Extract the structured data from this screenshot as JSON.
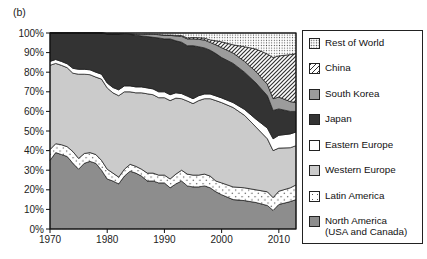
{
  "panel_label": "(b)",
  "chart_data": {
    "type": "area",
    "subtype": "stacked-100-percent",
    "title": "",
    "xlabel": "",
    "ylabel": "",
    "x_range": [
      1970,
      2013
    ],
    "x_ticks": [
      1970,
      1980,
      1990,
      2000,
      2010
    ],
    "y_ticks": [
      0,
      10,
      20,
      30,
      40,
      50,
      60,
      70,
      80,
      90,
      100
    ],
    "y_tick_suffix": "%",
    "ylim": [
      0,
      100
    ],
    "grid": false,
    "legend_position": "right",
    "years": [
      1970,
      1971,
      1972,
      1973,
      1974,
      1975,
      1976,
      1977,
      1978,
      1979,
      1980,
      1981,
      1982,
      1983,
      1984,
      1985,
      1986,
      1987,
      1988,
      1989,
      1990,
      1991,
      1992,
      1993,
      1994,
      1995,
      1996,
      1997,
      1998,
      1999,
      2000,
      2002,
      2004,
      2006,
      2008,
      2009,
      2010,
      2012,
      2013
    ],
    "series": [
      {
        "id": "north-america",
        "name": "North America (USA and Canada)",
        "fill": "#8d8d8d",
        "values": [
          35,
          39,
          38,
          37,
          33.5,
          30.5,
          33.5,
          34.5,
          33.5,
          30,
          25.5,
          24.5,
          23,
          27,
          29.5,
          28.5,
          27,
          24.5,
          24.5,
          23.5,
          23.5,
          21,
          23,
          24.5,
          22,
          21.5,
          21.5,
          22,
          21,
          19,
          17.5,
          15,
          14.5,
          13.5,
          12,
          9.5,
          12.5,
          14,
          15
        ]
      },
      {
        "id": "latin-america",
        "name": "Latin America",
        "fill": "p-dots-sparse",
        "values": [
          5.5,
          4.5,
          5,
          5,
          6,
          5.5,
          5,
          4.5,
          4.5,
          5,
          5,
          4,
          3.5,
          3.5,
          3.5,
          3.5,
          3.5,
          4,
          4,
          4,
          4,
          4.5,
          5,
          5.5,
          6,
          6,
          6,
          6,
          6,
          5.5,
          6,
          6.5,
          6.5,
          6.5,
          7,
          6.5,
          6.8,
          7,
          7.5
        ]
      },
      {
        "id": "western-europe",
        "name": "Western Europe",
        "fill": "#cbcbcb",
        "values": [
          43,
          41,
          40.5,
          40.3,
          40,
          43,
          40.5,
          39.7,
          39.5,
          41.5,
          41.5,
          41,
          41.5,
          39.5,
          37,
          37.5,
          39,
          40.5,
          40,
          39.5,
          39.5,
          40,
          38.8,
          36.5,
          37.3,
          36.5,
          38,
          38.5,
          39.5,
          41,
          41,
          40.5,
          37,
          32,
          27,
          24,
          22,
          20.5,
          20
        ]
      },
      {
        "id": "eastern-europe",
        "name": "Eastern Europe",
        "fill": "#ffffff",
        "values": [
          2,
          2,
          2,
          2,
          2.5,
          2.5,
          2.5,
          2.5,
          2.5,
          2.5,
          2.5,
          2.7,
          3,
          3,
          3,
          3,
          3,
          3,
          3,
          3,
          3,
          3,
          2.7,
          2.6,
          2.5,
          2.5,
          2.5,
          2.4,
          2.4,
          2.4,
          2.4,
          2.5,
          3,
          4,
          5.5,
          6,
          6.5,
          7,
          7
        ]
      },
      {
        "id": "japan",
        "name": "Japan",
        "fill": "#333333",
        "values": [
          14.5,
          13.5,
          14.5,
          15.7,
          18,
          18.5,
          18.5,
          18.8,
          20,
          21,
          25,
          27.3,
          28.5,
          26.4,
          26.3,
          26.4,
          26,
          26.2,
          26.3,
          27.5,
          27,
          28.5,
          26.5,
          26.2,
          25.7,
          27,
          25,
          23.5,
          22.3,
          21.6,
          20.6,
          20,
          19,
          18.5,
          16.5,
          14.5,
          13.5,
          11.5,
          10.5
        ]
      },
      {
        "id": "south-korea",
        "name": "South Korea",
        "fill": "#9c9c9c",
        "values": [
          0,
          0,
          0,
          0,
          0,
          0,
          0,
          0,
          0,
          0,
          0.2,
          0.2,
          0.2,
          0.3,
          0.3,
          0.5,
          0.8,
          1.2,
          1.5,
          1.7,
          2,
          1.8,
          2.5,
          3,
          3.5,
          3.5,
          3.8,
          4,
          4,
          4.5,
          5,
          5.3,
          5.5,
          5.8,
          5.8,
          6,
          6,
          5,
          4.5
        ]
      },
      {
        "id": "china",
        "name": "China",
        "fill": "p-hatch",
        "values": [
          0,
          0,
          0,
          0,
          0,
          0,
          0,
          0,
          0,
          0,
          0,
          0,
          0,
          0,
          0,
          0,
          0,
          0,
          0,
          0,
          0,
          0.2,
          0.3,
          0.4,
          0.5,
          0.7,
          0.8,
          1,
          1.3,
          2,
          3,
          4.2,
          7.5,
          11.5,
          15.5,
          21,
          21,
          24,
          25
        ]
      },
      {
        "id": "rest-of-world",
        "name": "Rest of World",
        "fill": "p-dots-fine",
        "values": [
          0,
          0,
          0,
          0,
          0,
          0,
          0,
          0,
          0,
          0,
          0.3,
          0.3,
          0.3,
          0.3,
          0.4,
          0.6,
          0.7,
          0.6,
          0.7,
          0.8,
          1,
          1,
          1.2,
          1.3,
          2.5,
          2.3,
          2.4,
          2.6,
          3.5,
          4,
          4.5,
          6,
          7,
          8.2,
          10.7,
          12.5,
          11.7,
          11,
          10.5
        ]
      }
    ]
  },
  "legend": {
    "items": [
      {
        "label": "Rest of World",
        "swatch": "dots-fine"
      },
      {
        "label": "China",
        "swatch": "hatch"
      },
      {
        "label": "South Korea",
        "swatch": "solid",
        "color": "#9c9c9c"
      },
      {
        "label": "Japan",
        "swatch": "solid",
        "color": "#333333"
      },
      {
        "label": "Eastern Europe",
        "swatch": "solid",
        "color": "#ffffff"
      },
      {
        "label": "Western Europe",
        "swatch": "solid",
        "color": "#cbcbcb"
      },
      {
        "label": "Latin America",
        "swatch": "dots-sparse"
      },
      {
        "label": "North America",
        "label2": "(USA and Canada)",
        "swatch": "solid",
        "color": "#8d8d8d"
      }
    ]
  }
}
